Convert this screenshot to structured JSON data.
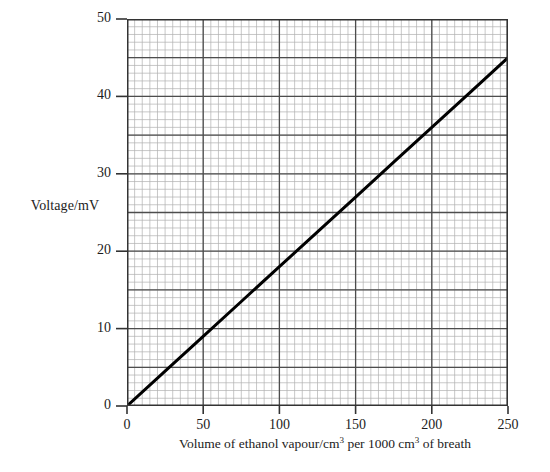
{
  "chart_data": {
    "type": "line",
    "title": "",
    "xlabel": "Volume of ethanol vapour/cm3 per 1000 cm3 of breath",
    "xlabel_parts": {
      "pre": "Volume of ethanol vapour/cm",
      "sup1": "3",
      "mid": " per 1000 cm",
      "sup2": "3",
      "post": " of breath"
    },
    "ylabel": "Voltage/mV",
    "xlim": [
      0,
      250
    ],
    "ylim": [
      0,
      50
    ],
    "xticks": [
      0,
      50,
      100,
      150,
      200,
      250
    ],
    "xtick_labels": [
      "0",
      "50",
      "100",
      "150",
      "200",
      "250"
    ],
    "yticks": [
      0,
      10,
      20,
      30,
      40,
      50
    ],
    "ytick_labels": [
      "0",
      "10",
      "20",
      "30",
      "40",
      "50"
    ],
    "grid": true,
    "grid_minor_x_step": 5,
    "grid_major_x_step": 50,
    "grid_minor_y_step": 1,
    "grid_major_y_step": 5,
    "legend": null,
    "legend_position": "none",
    "series": [
      {
        "name": "calibration line",
        "color": "#000000",
        "linewidth": 3,
        "x": [
          0,
          25,
          50,
          75,
          100,
          125,
          150,
          175,
          200,
          225,
          250
        ],
        "values": [
          0,
          4.5,
          9,
          13.5,
          18,
          22.5,
          27,
          31.5,
          36,
          40.5,
          45
        ]
      }
    ],
    "annotations": []
  },
  "style": {
    "background": "#ffffff",
    "axis_color": "#333333",
    "major_grid_color": "#4d4d4d",
    "minor_grid_color": "#b0b0b0",
    "text_color": "#1c1c1c"
  }
}
